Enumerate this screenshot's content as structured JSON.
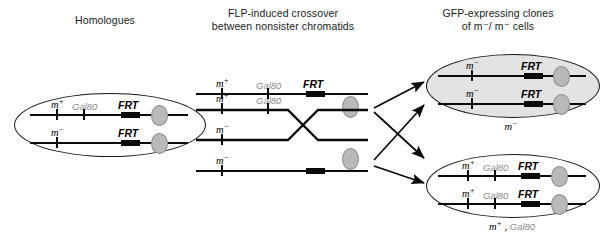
{
  "figure": {
    "kind": "genetics-mosaic-clone-diagram",
    "width": 612,
    "height": 244,
    "background": "#ffffff"
  },
  "panels": {
    "left": {
      "title": "Homologues",
      "cell": {
        "shaded": false,
        "caption": "",
        "chromosomes": [
          {
            "m_label": "m",
            "m_sign": "+",
            "gal80": "Gal80",
            "frt": "FRT"
          },
          {
            "m_label": "m",
            "m_sign": "-",
            "gal80": "",
            "frt": "FRT"
          }
        ]
      }
    },
    "middle": {
      "title": "FLP-induced crossover\nbetween nonsister chromatids",
      "chromatids": [
        {
          "m_label": "m",
          "m_sign": "+",
          "gal80": "Gal80",
          "frt": "FRT"
        },
        {
          "m_label": "m",
          "m_sign": "+",
          "gal80": "Gal80",
          "frt": ""
        },
        {
          "m_label": "m",
          "m_sign": "-",
          "gal80": "",
          "frt": ""
        },
        {
          "m_label": "m",
          "m_sign": "-",
          "gal80": "",
          "frt": ""
        }
      ],
      "crossover_symbol": "X"
    },
    "right": {
      "title": "GFP-expressing clones\nof m⁻/ m⁻ cells",
      "cells": [
        {
          "shaded": true,
          "caption_m": "m",
          "caption_sign": "-",
          "caption_gal80": "",
          "chromosomes": [
            {
              "m_label": "m",
              "m_sign": "-",
              "gal80": "",
              "frt": "FRT"
            },
            {
              "m_label": "m",
              "m_sign": "-",
              "gal80": "",
              "frt": "FRT"
            }
          ]
        },
        {
          "shaded": false,
          "caption_m": "m",
          "caption_sign": "+",
          "caption_gal80": "Gal80",
          "chromosomes": [
            {
              "m_label": "m",
              "m_sign": "+",
              "gal80": "Gal80",
              "frt": "FRT"
            },
            {
              "m_label": "m",
              "m_sign": "+",
              "gal80": "Gal80",
              "frt": "FRT"
            }
          ]
        }
      ]
    }
  },
  "colors": {
    "line": "#0a0a0a",
    "centromere_fill": "#b9b9b9",
    "centromere_stroke": "#8e8e8e",
    "cell_outline": "#161616",
    "cell_shaded_fill": "#e3e3e3",
    "gal80_text": "#8a8a8a",
    "text": "#1a1a1a"
  },
  "arrows": {
    "count": 4,
    "style": "solid-filled-head"
  }
}
